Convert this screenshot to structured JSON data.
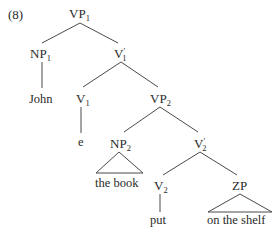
{
  "example_number": "(8)",
  "nodes": {
    "vp1": {
      "base": "VP",
      "sub": "1",
      "prime": ""
    },
    "np1": {
      "base": "NP",
      "sub": "1",
      "prime": ""
    },
    "v1bar": {
      "base": "V",
      "sub": "1",
      "prime": "′"
    },
    "v1": {
      "base": "V",
      "sub": "1",
      "prime": ""
    },
    "vp2": {
      "base": "VP",
      "sub": "2",
      "prime": ""
    },
    "np2": {
      "base": "NP",
      "sub": "2",
      "prime": ""
    },
    "v2bar": {
      "base": "V",
      "sub": "2",
      "prime": "′"
    },
    "v2": {
      "base": "V",
      "sub": "2",
      "prime": ""
    },
    "zp": {
      "base": "ZP",
      "sub": "",
      "prime": ""
    }
  },
  "leaves": {
    "john": "John",
    "e": "e",
    "the_book": "the book",
    "put": "put",
    "on_the_shelf": "on the shelf"
  },
  "tree_structure": {
    "VP1": [
      "NP1",
      "V'1"
    ],
    "NP1": [
      "John"
    ],
    "V'1": [
      "V1",
      "VP2"
    ],
    "V1": [
      "e"
    ],
    "VP2": [
      "NP2",
      "V'2"
    ],
    "NP2": [
      "the book (triangle)"
    ],
    "V'2": [
      "V2",
      "ZP"
    ],
    "V2": [
      "put"
    ],
    "ZP": [
      "on the shelf (triangle)"
    ]
  }
}
